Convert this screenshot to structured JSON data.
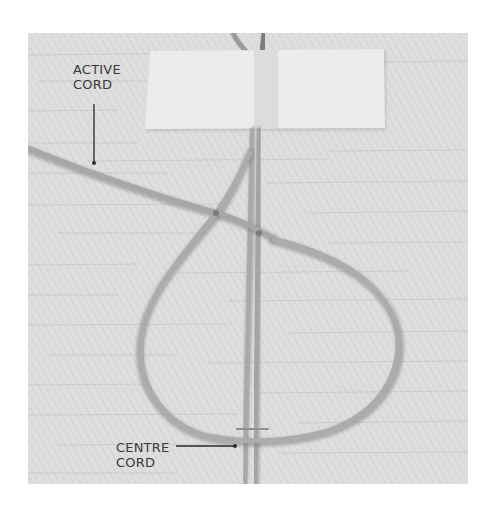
{
  "image": {
    "description": "Photograph of macramé cords on a textured light grey surface, with a strip of masking tape at the top, an active cord forming a loop around the centre cords, and two callout labels.",
    "colors": {
      "background": "#dcdcdc",
      "tape": "#ececec",
      "cord": "#a9a9a9",
      "cord_shadow": "#8e8e8e",
      "label_text": "#3a3a3a",
      "callout_line": "#2a2a2a"
    }
  },
  "labels": {
    "active_cord": {
      "line1": "ACTIVE",
      "line2": "CORD"
    },
    "centre_cord": {
      "line1": "CENTRE",
      "line2": "CORD"
    }
  }
}
